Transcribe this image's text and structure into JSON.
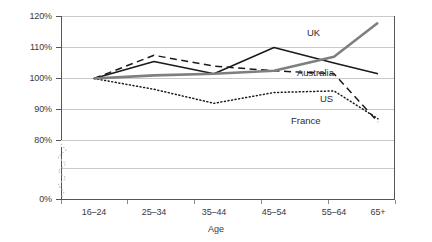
{
  "chart_data": {
    "type": "line",
    "title": "",
    "xlabel": "Age",
    "ylabel": "",
    "categories": [
      "16–24",
      "25–34",
      "35–44",
      "45–54",
      "55–64",
      "65+"
    ],
    "ytick_labels": [
      "120%",
      "110%",
      "100%",
      "90%",
      "80%",
      "0%"
    ],
    "ytick_values": [
      120,
      110,
      100,
      90,
      80,
      0
    ],
    "ylim": [
      0,
      120
    ],
    "axis_break": true,
    "axis_break_note": "zigzag break on value axis between 0% and 80%",
    "grid": "horizontal",
    "legend_position": "inline-right",
    "series": [
      {
        "name": "UK",
        "style": "solid-thick",
        "color": "#7f7f7f",
        "values": [
          100,
          101,
          101.5,
          102.5,
          107,
          118
        ]
      },
      {
        "name": "Australia",
        "style": "solid",
        "color": "#1a1a1a",
        "values": [
          100,
          105.5,
          101.5,
          110,
          105,
          101.5
        ]
      },
      {
        "name": "US",
        "style": "dashed",
        "color": "#1a1a1a",
        "values": [
          100,
          107.5,
          104,
          102.5,
          101.5,
          86
        ]
      },
      {
        "name": "France",
        "style": "dotted",
        "color": "#1a1a1a",
        "values": [
          100,
          96.5,
          92,
          95.5,
          96,
          87
        ]
      }
    ],
    "annotations": [
      {
        "text": "UK",
        "series": "UK"
      },
      {
        "text": "Australia",
        "series": "Australia"
      },
      {
        "text": "US",
        "series": "US"
      },
      {
        "text": "France",
        "series": "France"
      }
    ]
  },
  "axis": {
    "x_title": "Age"
  },
  "yticks": {
    "t0": "120%",
    "t1": "110%",
    "t2": "100%",
    "t3": "90%",
    "t4": "80%",
    "t5": "0%"
  },
  "xticks": {
    "t0": "16–24",
    "t1": "25–34",
    "t2": "35–44",
    "t3": "45–54",
    "t4": "55–64",
    "t5": "65+"
  },
  "labels": {
    "uk": "UK",
    "australia": "Australia",
    "us": "US",
    "france": "France"
  },
  "colors": {
    "uk_line": "#7f7f7f",
    "other_lines": "#1a1a1a",
    "grid": "#c9c9c9",
    "axis": "#555555",
    "text": "#3a3a3a"
  }
}
